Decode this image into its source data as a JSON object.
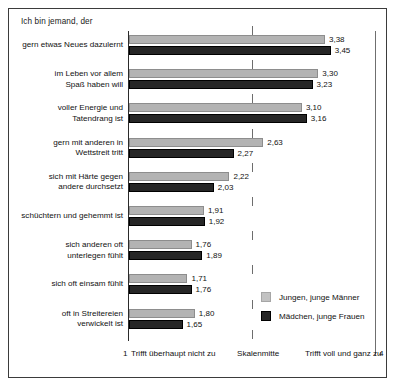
{
  "chart_data": {
    "type": "bar",
    "orientation": "horizontal",
    "title": "Ich bin jemand, der",
    "xlabel": "",
    "ylabel": "",
    "xlim": [
      1,
      4
    ],
    "grid": false,
    "legend_position": "bottom-right",
    "axis": {
      "min_value": "1",
      "min_label": "Trifft überhaupt nicht zu",
      "mid_label": "Skalenmitte",
      "mid_value": 2.5,
      "max_label": "Trifft voll und ganz zu",
      "max_value": "4"
    },
    "categories": [
      "gern etwas Neues dazulernt",
      "im Leben vor allem\nSpaß haben will",
      "voller Energie und\nTatendrang ist",
      "gern mit anderen in\nWettstreit tritt",
      "sich mit Härte gegen\nandere durchsetzt",
      "schüchtern und gehemmt ist",
      "sich anderen oft\nunterlegen fühlt",
      "sich oft einsam fühlt",
      "oft in Streitereien\nverwickelt ist"
    ],
    "series": [
      {
        "name": "Jungen, junge Männer",
        "color": "#b3b3b3",
        "values": [
          3.38,
          3.3,
          3.1,
          2.63,
          2.22,
          1.91,
          1.76,
          1.71,
          1.8
        ],
        "labels": [
          "3,38",
          "3,30",
          "3,10",
          "2,63",
          "2,22",
          "1,91",
          "1,76",
          "1,71",
          "1,80"
        ]
      },
      {
        "name": "Mädchen, junge Frauen",
        "color": "#262626",
        "values": [
          3.45,
          3.23,
          3.16,
          2.27,
          2.03,
          1.92,
          1.89,
          1.76,
          1.65
        ],
        "labels": [
          "3,45",
          "3,23",
          "3,16",
          "2,27",
          "2,03",
          "1,92",
          "1,89",
          "1,76",
          "1,65"
        ]
      }
    ]
  },
  "legend": {
    "items": [
      {
        "label": "Jungen, junge Männer"
      },
      {
        "label": "Mädchen, junge Frauen"
      }
    ]
  },
  "category_lines": [
    [
      "gern etwas Neues dazulernt"
    ],
    [
      "im Leben vor allem",
      "Spaß haben will"
    ],
    [
      "voller Energie und",
      "Tatendrang ist"
    ],
    [
      "gern mit anderen in",
      "Wettstreit tritt"
    ],
    [
      "sich mit Härte gegen",
      "andere durchsetzt"
    ],
    [
      "schüchtern und gehemmt ist"
    ],
    [
      "sich anderen oft",
      "unterlegen fühlt"
    ],
    [
      "sich oft einsam fühlt"
    ],
    [
      "oft in Streitereien",
      "verwickelt ist"
    ]
  ]
}
